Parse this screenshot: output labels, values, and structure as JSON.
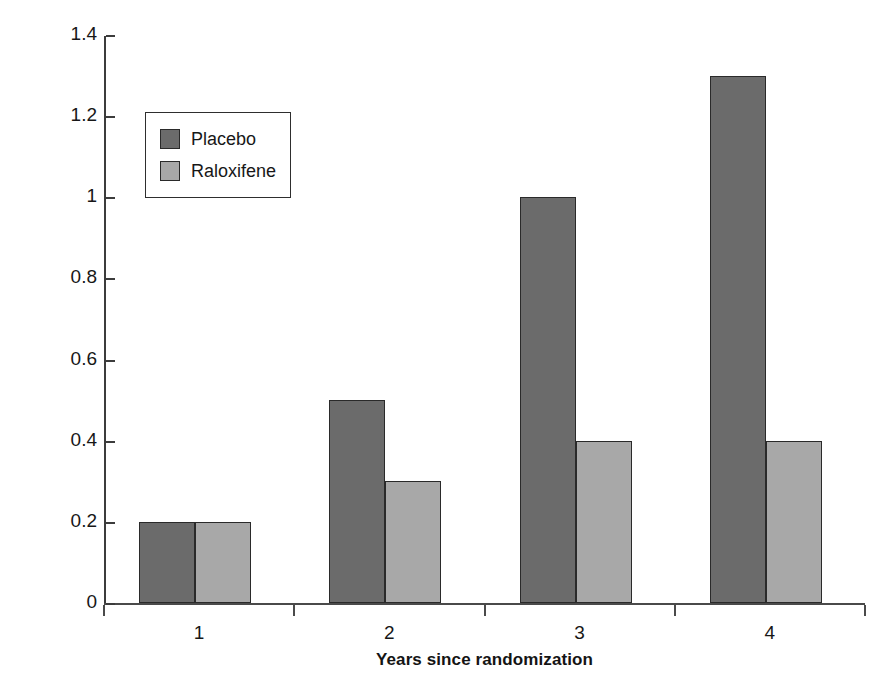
{
  "chart_data": {
    "type": "bar",
    "title": "",
    "subtitle": "",
    "xlabel": "Years since randomization",
    "ylabel": "Percent of randomized patients",
    "categories": [
      "1",
      "2",
      "3",
      "4"
    ],
    "series": [
      {
        "name": "Placebo",
        "color": "#6b6b6b",
        "values": [
          0.2,
          0.5,
          1.0,
          1.3
        ]
      },
      {
        "name": "Raloxifene",
        "color": "#a8a8a8",
        "values": [
          0.2,
          0.3,
          0.4,
          0.4
        ]
      }
    ],
    "ylim": [
      0,
      1.4
    ],
    "yticks": [
      0,
      0.2,
      0.4,
      0.6,
      0.8,
      1,
      1.2,
      1.4
    ],
    "ytick_labels": [
      "0",
      "0.2",
      "0.4",
      "0.6",
      "0.8",
      "1",
      "1.2",
      "1.4"
    ],
    "grid": false,
    "legend_position": "upper-left-inside",
    "annotations": []
  },
  "legend": {
    "entries": [
      {
        "label": "Placebo",
        "swatch_color": "#6b6b6b"
      },
      {
        "label": "Raloxifene",
        "swatch_color": "#a8a8a8"
      }
    ]
  },
  "colors": {
    "placebo": "#6b6b6b",
    "raloxifene": "#a8a8a8",
    "axis": "#3c3c3c",
    "bar_outline": "#2a2a2a",
    "background": "#ffffff"
  }
}
